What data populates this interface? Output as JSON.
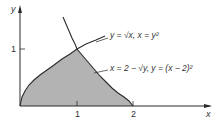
{
  "diagram": {
    "axes": {
      "x_label": "x",
      "y_label": "y",
      "x_ticks": [
        "1",
        "2"
      ],
      "y_ticks": [
        "1"
      ]
    },
    "curves": [
      {
        "name": "sqrt-curve",
        "label": "y = √x,  x = y²"
      },
      {
        "name": "parabola-curve",
        "label": "x = 2 − √y,  y = (x − 2)²"
      }
    ],
    "shaded_region": {
      "description": "Region bounded by y = √x, y = (x − 2)², and the x-axis",
      "fill_color": "#b3b3b3"
    },
    "colors": {
      "stroke": "#2b2b2b",
      "fill": "#b3b3b3",
      "background": "#ffffff"
    }
  }
}
